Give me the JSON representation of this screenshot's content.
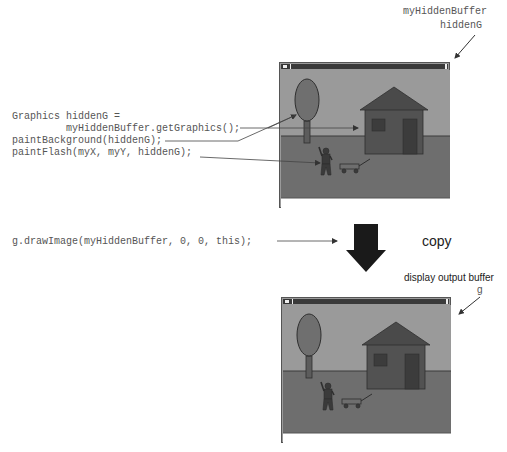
{
  "code": {
    "line1": "Graphics hiddenG =",
    "line2": "         myHiddenBuffer.getGraphics();",
    "line3": "paintBackground(hiddenG);",
    "line4": "paintFlash(myX, myY, hiddenG);",
    "draw_line": "g.drawImage(myHiddenBuffer, 0, 0, this);"
  },
  "top_buffer": {
    "label_line1": "myHiddenBuffer",
    "label_line2": "hiddenG"
  },
  "copy_label": "copy",
  "bottom_buffer": {
    "label_line1": "display output buffer",
    "label_line2": "g"
  },
  "scene": {
    "elements": [
      "tree",
      "house",
      "person",
      "wagon"
    ],
    "colors": {
      "sky": "#9a9a9a",
      "ground": "#6e6e6e",
      "tree_foliage": "#6f6f6f",
      "tree_trunk": "#5c5c5c",
      "house_wall": "#525252",
      "house_roof": "#4a4a4a",
      "house_window": "#3c3c3c",
      "figure": "#3a3a3a",
      "outline": "#2e2e2e",
      "arrow": "#1a1a1a",
      "code_text": "#555555"
    }
  }
}
